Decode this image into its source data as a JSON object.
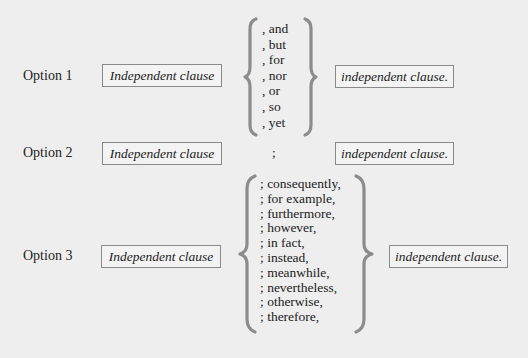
{
  "options": [
    {
      "label": "Option 1",
      "left_clause": "Independent clause",
      "connectors": [
        ", and",
        ", but",
        ", for",
        ", nor",
        ", or",
        ", so",
        ", yet"
      ],
      "right_clause": "independent clause."
    },
    {
      "label": "Option 2",
      "left_clause": "Independent clause",
      "connector": ";",
      "right_clause": "independent clause."
    },
    {
      "label": "Option 3",
      "left_clause": "Independent clause",
      "connectors": [
        "; consequently,",
        "; for example,",
        "; furthermore,",
        "; however,",
        "; in fact,",
        "; instead,",
        "; meanwhile,",
        "; nevertheless,",
        "; otherwise,",
        "; therefore,"
      ],
      "right_clause": "independent clause."
    }
  ],
  "colors": {
    "background": "#eeeeee",
    "box_border": "#8a8a8a",
    "brace": "#8c8c8c",
    "text": "#222222"
  }
}
